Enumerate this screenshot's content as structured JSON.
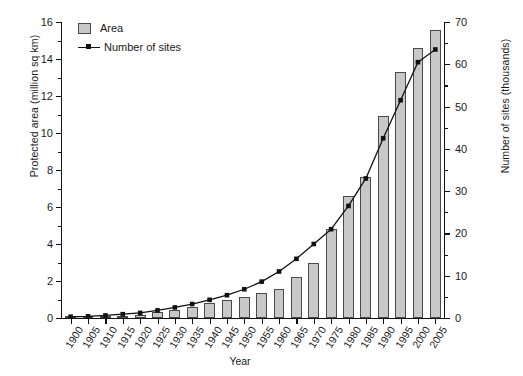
{
  "chart_data": {
    "type": "bar",
    "title": "",
    "xlabel": "Year",
    "ylabel": "Protected area (million sq km)",
    "y2label": "Number of sites (thousands)",
    "grid": false,
    "legend_position": "top-left",
    "categories": [
      "1900",
      "1905",
      "1910",
      "1915",
      "1920",
      "1925",
      "1930",
      "1935",
      "1940",
      "1945",
      "1950",
      "1955",
      "1960",
      "1965",
      "1970",
      "1975",
      "1980",
      "1985",
      "1990",
      "1995",
      "2000",
      "2005"
    ],
    "ylim": [
      0,
      16
    ],
    "yticks": [
      0,
      2,
      4,
      6,
      8,
      10,
      12,
      14,
      16
    ],
    "ytick_labels": [
      "0",
      "2",
      "4",
      "6",
      "8",
      "10",
      "12",
      "14",
      "16"
    ],
    "y2lim": [
      0,
      70
    ],
    "y2ticks": [
      0,
      10,
      20,
      30,
      40,
      50,
      60,
      70
    ],
    "y2tick_labels": [
      "0",
      "10",
      "20",
      "30",
      "40",
      "50",
      "60",
      "70"
    ],
    "series": [
      {
        "name": "Area",
        "kind": "bar",
        "axis": "left",
        "units": "million sq km",
        "color": "#c8c8c8",
        "edge_color": "#4a4a4a",
        "values": [
          0.03,
          0.05,
          0.08,
          0.12,
          0.18,
          0.3,
          0.45,
          0.62,
          0.8,
          0.95,
          1.15,
          1.35,
          1.55,
          2.2,
          3.0,
          4.8,
          6.6,
          7.6,
          10.9,
          13.3,
          14.6,
          15.55
        ]
      },
      {
        "name": "Number of sites",
        "kind": "line",
        "axis": "right",
        "units": "thousands",
        "color": "#111111",
        "marker": "square",
        "values": [
          0.3,
          0.4,
          0.6,
          0.9,
          1.2,
          1.8,
          2.5,
          3.3,
          4.3,
          5.4,
          6.8,
          8.6,
          11.0,
          14.0,
          17.5,
          21.0,
          26.5,
          33.0,
          42.5,
          51.5,
          60.5,
          63.5
        ]
      }
    ]
  },
  "legend": {
    "entries": [
      {
        "label": "Area",
        "type": "swatch"
      },
      {
        "label": "Number of sites",
        "type": "line-marker"
      }
    ]
  },
  "axes": {
    "left_title": "Protected area (million sq km)",
    "right_title": "Number of sites (thousands)",
    "bottom_title": "Year"
  }
}
